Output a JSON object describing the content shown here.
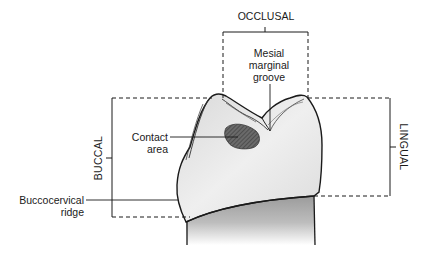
{
  "diagram": {
    "labels": {
      "occlusal": "OCCLUSAL",
      "buccal": "BUCCAL",
      "lingual": "LINGUAL",
      "mesial_marginal_groove": "Mesial\nmarginal\ngroove",
      "mesial_marginal_groove_lines": [
        "Mesial",
        "marginal",
        "groove"
      ],
      "contact_area_lines": [
        "Contact",
        "area"
      ],
      "buccocervical_ridge_lines": [
        "Buccocervical",
        "ridge"
      ]
    },
    "colors": {
      "line": "#1a1a1a",
      "crown_fill": "#e6e6e6",
      "root_fill": "#b8b8b8",
      "contact_area": "#555555"
    }
  }
}
